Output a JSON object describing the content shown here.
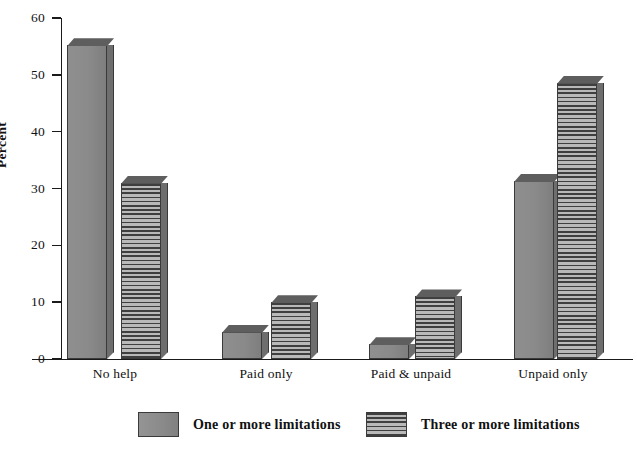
{
  "chart_data": {
    "type": "bar",
    "title": "",
    "subtitle": "",
    "xlabel": "",
    "ylabel": "Percent",
    "ylim": [
      0,
      60
    ],
    "yticks": [
      0,
      10,
      20,
      30,
      40,
      50,
      60
    ],
    "ytick_labels": [
      "0",
      "10",
      "20",
      "30",
      "40",
      "50",
      "60"
    ],
    "grid": false,
    "legend_position": "bottom",
    "categories": [
      "No help",
      "Paid only",
      "Paid & unpaid",
      "Unpaid only"
    ],
    "series": [
      {
        "name": "One or more limitations",
        "pattern": "solid",
        "color": "#8a8a8a",
        "values": [
          55.2,
          4.8,
          2.6,
          31.3
        ]
      },
      {
        "name": "Three or more limitations",
        "pattern": "horizontal-stripes",
        "color": "#b9b9b9",
        "values": [
          31.0,
          10.0,
          11.0,
          48.6
        ]
      }
    ]
  },
  "axis": {
    "y_title": "Percent"
  },
  "legend": {
    "items": [
      {
        "label": "One or more limitations",
        "swatch": "solid-gray-swatch"
      },
      {
        "label": "Three or more limitations",
        "swatch": "striped-gray-swatch"
      }
    ]
  },
  "colors": {
    "bar_solid": "#8a8a8a",
    "bar_stripe_dark": "#3f3f3f",
    "bar_stripe_light": "#b9b9b9",
    "axis": "#1a1a1a",
    "background": "#ffffff"
  }
}
